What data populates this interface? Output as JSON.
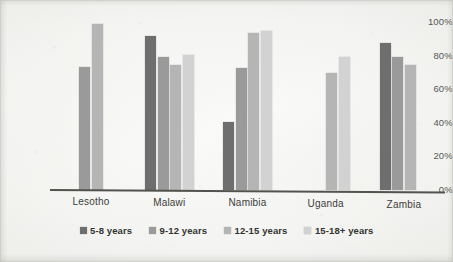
{
  "chart_data": {
    "type": "bar",
    "title": "",
    "subtitle": "",
    "xlabel": "",
    "ylabel": "",
    "ylim": [
      0,
      100
    ],
    "yticks": [
      "0%",
      "20%",
      "40%",
      "60%",
      "80%",
      "100%"
    ],
    "ytick_values": [
      0,
      20,
      40,
      60,
      80,
      100
    ],
    "grid": false,
    "legend_position": "bottom",
    "categories": [
      "Lesotho",
      "Malawi",
      "Namibia",
      "Uganda",
      "Zambia"
    ],
    "series": [
      {
        "name": "5-8 years",
        "color": "#6e6e6e",
        "values": [
          null,
          91,
          40,
          null,
          87
        ]
      },
      {
        "name": "9-12 years",
        "color": "#9a9a9a",
        "values": [
          73,
          79,
          72,
          null,
          79
        ]
      },
      {
        "name": "12-15 years",
        "color": "#b5b5b5",
        "values": [
          98,
          74,
          93,
          69,
          74
        ]
      },
      {
        "name": "15-18+ years",
        "color": "#d2d2d2",
        "values": [
          null,
          80,
          94,
          79,
          null
        ]
      }
    ]
  },
  "axis": {
    "baseline_color": "#52524f"
  },
  "legend": {
    "items": [
      {
        "label": "5-8 years",
        "color": "#6e6e6e"
      },
      {
        "label": "9-12 years",
        "color": "#9a9a9a"
      },
      {
        "label": "12-15 years",
        "color": "#b5b5b5"
      },
      {
        "label": "15-18+ years",
        "color": "#d2d2d2"
      }
    ]
  }
}
